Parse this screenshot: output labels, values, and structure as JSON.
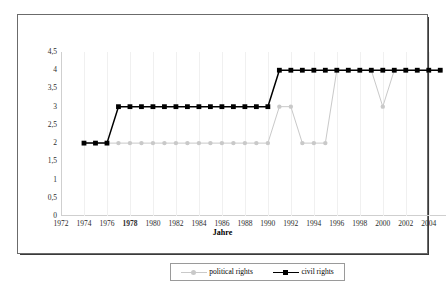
{
  "chart_data": {
    "type": "line",
    "title": "",
    "xlabel": "Jahre",
    "ylabel": "",
    "xlim": [
      1972,
      2005.5
    ],
    "ylim": [
      0,
      4.5
    ],
    "grid": true,
    "legend_position": "bottom",
    "x_tick_labels": [
      "1972",
      "1974",
      "1976",
      "1978",
      "1980",
      "1982",
      "1984",
      "1986",
      "1988",
      "1990",
      "1992",
      "1994",
      "1996",
      "1998",
      "2000",
      "2002",
      "2004"
    ],
    "x_tick_values": [
      1972,
      1974,
      1976,
      1978,
      1980,
      1982,
      1984,
      1986,
      1988,
      1990,
      1992,
      1994,
      1996,
      1998,
      2000,
      2002,
      2004
    ],
    "x_tick_bold": [
      "1978"
    ],
    "y_tick_labels": [
      "0",
      "0,5",
      "1",
      "1,5",
      "2",
      "2,5",
      "3",
      "3,5",
      "4",
      "4,5"
    ],
    "y_tick_values": [
      0,
      0.5,
      1,
      1.5,
      2,
      2.5,
      3,
      3.5,
      4,
      4.5
    ],
    "x": [
      1974,
      1975,
      1976,
      1977,
      1978,
      1979,
      1980,
      1981,
      1982,
      1983,
      1984,
      1985,
      1986,
      1987,
      1988,
      1989,
      1990,
      1991,
      1992,
      1993,
      1994,
      1995,
      1996,
      1997,
      1998,
      1999,
      2000,
      2001,
      2002,
      2003,
      2004,
      2005
    ],
    "series": [
      {
        "name": "political rights",
        "color": "#c9c9c9",
        "marker": "circle",
        "values": [
          2,
          2,
          2,
          2,
          2,
          2,
          2,
          2,
          2,
          2,
          2,
          2,
          2,
          2,
          2,
          2,
          2,
          3,
          3,
          2,
          2,
          2,
          4,
          4,
          4,
          4,
          3,
          4,
          4,
          4,
          4,
          4
        ]
      },
      {
        "name": "civil rights",
        "color": "#000000",
        "marker": "square",
        "values": [
          2,
          2,
          2,
          3,
          3,
          3,
          3,
          3,
          3,
          3,
          3,
          3,
          3,
          3,
          3,
          3,
          3,
          4,
          4,
          4,
          4,
          4,
          4,
          4,
          4,
          4,
          4,
          4,
          4,
          4,
          4,
          4
        ]
      }
    ]
  },
  "legend": {
    "items": [
      {
        "label": "political rights"
      },
      {
        "label": "civil rights"
      }
    ]
  },
  "axis": {
    "x_title": "Jahre"
  }
}
